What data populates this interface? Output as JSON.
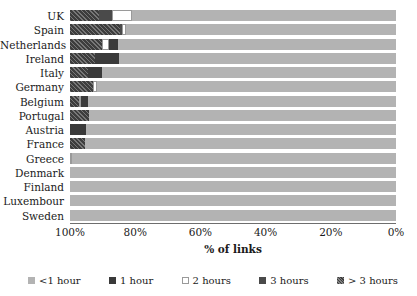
{
  "chart_data": {
    "type": "bar",
    "orientation": "horizontal",
    "stacked": true,
    "title": "",
    "xlabel": "% of links",
    "ylabel": "",
    "xlim": [
      100,
      0
    ],
    "x_reversed": true,
    "grid": false,
    "legend_position": "bottom",
    "xticks": [
      "100%",
      "80%",
      "60%",
      "40%",
      "20%",
      "0%"
    ],
    "xtick_values": [
      100,
      80,
      60,
      40,
      20,
      0
    ],
    "categories": [
      "UK",
      "Spain",
      "Netherlands",
      "Ireland",
      "Italy",
      "Germany",
      "Belgium",
      "Portugal",
      "Austria",
      "France",
      "Greece",
      "Denmark",
      "Finland",
      "Luxembour",
      "Sweden"
    ],
    "series": [
      {
        "name": "<1 hour",
        "color": "#b3b3b3",
        "values": [
          81.0,
          82.8,
          85.3,
          85.0,
          90.2,
          91.7,
          94.5,
          94.2,
          95.1,
          95.4,
          99.4,
          100.0,
          100.0,
          100.0,
          100.0
        ]
      },
      {
        "name": "1 hour",
        "color": "#3a3a3a",
        "values": [
          0.0,
          0.0,
          2.8,
          7.4,
          4.3,
          0.0,
          2.1,
          0.0,
          4.9,
          0.0,
          0.0,
          0.0,
          0.0,
          0.0,
          0.0
        ]
      },
      {
        "name": "2 hours",
        "color": "#ffffff",
        "values": [
          6.1,
          1.2,
          2.1,
          0.0,
          0.0,
          1.3,
          0.6,
          0.0,
          0.0,
          0.0,
          0.6,
          0.0,
          0.0,
          0.0,
          0.0
        ]
      },
      {
        "name": "3 hours",
        "color": "#4a4a4a",
        "values": [
          4.0,
          0.7,
          0.0,
          0.0,
          0.0,
          0.0,
          0.0,
          0.0,
          0.0,
          0.0,
          0.0,
          0.0,
          0.0,
          0.0,
          0.0
        ]
      },
      {
        "name": "> 3 hours",
        "color": "#3d3d3d",
        "values": [
          8.9,
          15.3,
          9.8,
          7.6,
          5.5,
          7.0,
          2.8,
          5.8,
          0.0,
          4.6,
          0.0,
          0.0,
          0.0,
          0.0,
          0.0
        ]
      }
    ]
  },
  "legend": {
    "items": [
      {
        "label": "<1 hour"
      },
      {
        "label": "1 hour"
      },
      {
        "label": "2 hours"
      },
      {
        "label": "3 hours"
      },
      {
        "label": "> 3 hours"
      }
    ]
  }
}
